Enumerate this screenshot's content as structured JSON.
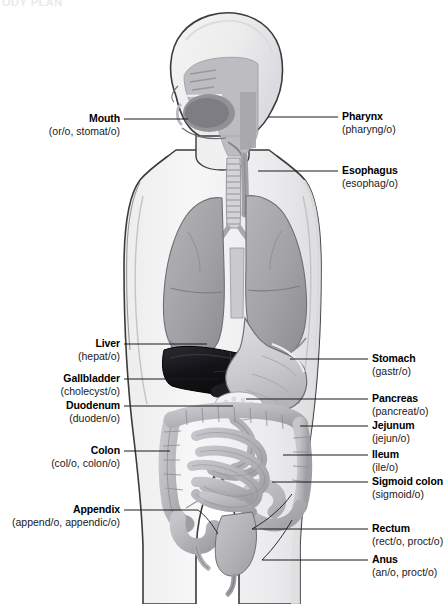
{
  "figure": {
    "title_fragment": "ODY PLAN",
    "width": 447,
    "height": 604
  },
  "colors": {
    "background": "#ffffff",
    "body_fill": "#f2f2f3",
    "body_outline": "#3b3b3b",
    "skin_shadow": "#e3e3e5",
    "lung": "#a9a9ac",
    "lung_shadow": "#949497",
    "liver": "#15151a",
    "stomach": "#cfcfd2",
    "intestine": "#b9b9bd",
    "pancreas": "#f4f4f6",
    "trachea": "#d7d7da",
    "cavity": "#b8b8bd",
    "leader_line": "#1a1a1a",
    "label_text": "#000000"
  },
  "labels_left": [
    {
      "term": "Mouth",
      "root": "(or/o, stomat/o)",
      "text_right": 120,
      "text_top": 112,
      "line_y": 119,
      "line_x1": 124,
      "line_x2": 188
    },
    {
      "term": "Liver",
      "root": "(hepat/o)",
      "text_right": 120,
      "text_top": 337,
      "line_y": 344,
      "line_x1": 124,
      "line_x2": 207
    },
    {
      "term": "Gallbladder",
      "root": "(cholecyst/o)",
      "text_right": 120,
      "text_top": 372,
      "line_y": 379,
      "line_x1": 124,
      "line_x2": 218
    },
    {
      "term": "Duodenum",
      "root": "(duoden/o)",
      "text_right": 120,
      "text_top": 399,
      "line_y": 406,
      "line_x1": 124,
      "line_x2": 233
    },
    {
      "term": "Colon",
      "root": "(col/o, colon/o)",
      "text_right": 120,
      "text_top": 444,
      "line_y": 451,
      "line_x1": 124,
      "line_x2": 170
    },
    {
      "term": "Appendix",
      "root": "(append/o, appendic/o)",
      "text_right": 120,
      "text_top": 503,
      "line_y": 510,
      "line_x1": 124,
      "line_x2": 198
    }
  ],
  "labels_right": [
    {
      "term": "Pharynx",
      "root": "(pharyng/o)",
      "text_left": 342,
      "text_top": 110,
      "line_y": 117,
      "line_x1": 268,
      "line_x2": 338
    },
    {
      "term": "Esophagus",
      "root": "(esophag/o)",
      "text_left": 342,
      "text_top": 164,
      "line_y": 171,
      "line_x1": 258,
      "line_x2": 338
    },
    {
      "term": "Stomach",
      "root": "(gastr/o)",
      "text_left": 372,
      "text_top": 352,
      "line_y": 359,
      "line_x1": 290,
      "line_x2": 368
    },
    {
      "term": "Pancreas",
      "root": "(pancreat/o)",
      "text_left": 372,
      "text_top": 392,
      "line_y": 399,
      "line_x1": 246,
      "line_x2": 368
    },
    {
      "term": "Jejunum",
      "root": "(jejun/o)",
      "text_left": 372,
      "text_top": 419,
      "line_y": 426,
      "line_x1": 300,
      "line_x2": 368
    },
    {
      "term": "Ileum",
      "root": "(ile/o)",
      "text_left": 372,
      "text_top": 448,
      "line_y": 455,
      "line_x1": 283,
      "line_x2": 368
    },
    {
      "term": "Sigmoid colon",
      "root": "(sigmoid/o)",
      "text_left": 372,
      "text_top": 475,
      "line_y": 482,
      "line_x1": 272,
      "line_x2": 368
    },
    {
      "term": "Rectum",
      "root": "(rect/o, proct/o)",
      "text_left": 372,
      "text_top": 522,
      "line_y": 529,
      "line_x1": 252,
      "line_x2": 368
    },
    {
      "term": "Anus",
      "root": "(an/o, proct/o)",
      "text_left": 372,
      "text_top": 553,
      "line_y": 560,
      "line_x1": 262,
      "line_x2": 368
    }
  ]
}
